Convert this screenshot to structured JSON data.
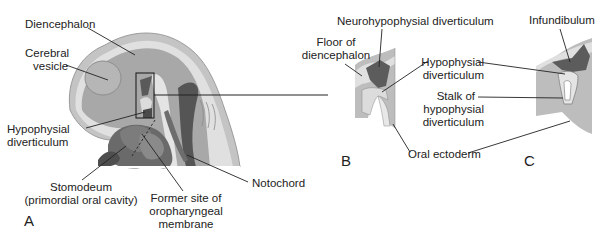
{
  "figure": {
    "panels": [
      {
        "id": "A",
        "letter": "A",
        "labels": {
          "diencephalon": "Diencephalon",
          "cerebral_vesicle_1": "Cerebral",
          "cerebral_vesicle_2": "vesicle",
          "hypophysial_div_1": "Hypophysial",
          "hypophysial_div_2": "diverticulum",
          "stomodeum_1": "Stomodeum",
          "stomodeum_2": "(primordial oral cavity)",
          "former_site_1": "Former site of",
          "former_site_2": "oropharyngeal",
          "former_site_3": "membrane",
          "notochord": "Notochord"
        }
      },
      {
        "id": "B",
        "letter": "B",
        "labels": {
          "neurohypophysial": "Neurohypophysial diverticulum",
          "floor_1": "Floor of",
          "floor_2": "diencephalon",
          "hypophysial_1": "Hypophysial",
          "hypophysial_2": "diverticulum",
          "stalk_1": "Stalk of",
          "stalk_2": "hypophysial",
          "stalk_3": "diverticulum",
          "oral_ectoderm": "Oral ectoderm"
        }
      },
      {
        "id": "C",
        "letter": "C",
        "labels": {
          "infundibulum": "Infundibulum"
        }
      }
    ],
    "colors": {
      "outer_tissue": "#bdbdbd",
      "light_layer": "#dcdcdc",
      "brain": "#a6a6a6",
      "dark": "#555555",
      "mid_dark": "#7a7a7a",
      "line": "#1a1a1a"
    }
  }
}
